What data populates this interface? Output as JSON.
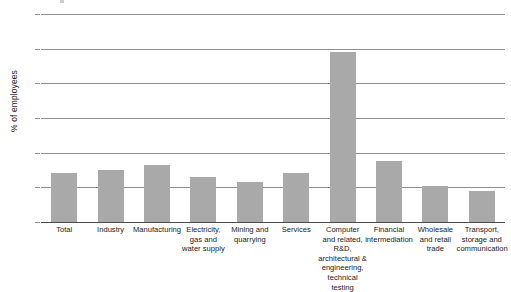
{
  "chart_data": {
    "type": "bar",
    "title": "",
    "xlabel": "",
    "ylabel": "% of employees",
    "ylim": [
      0,
      60
    ],
    "yticks": [
      0,
      10,
      20,
      30,
      40,
      50,
      60
    ],
    "grid": true,
    "legend": "none",
    "bar_color": "#a9a9a9",
    "categories": [
      "Total",
      "Industry",
      "Manufacturing",
      "Electricity,\ngas and\nwater supply",
      "Mining and\nquarrying",
      "Services",
      "Computer\nand related,\nR&D,\narchitectural &\nengineering,\ntechnical testing",
      "Financial\nintermediation",
      "Wholesale\nand retail\ntrade",
      "Transport,\nstorage and\ncommunication"
    ],
    "values": [
      14,
      15,
      16.5,
      13,
      11.5,
      14,
      49,
      17.5,
      10.5,
      9
    ]
  }
}
